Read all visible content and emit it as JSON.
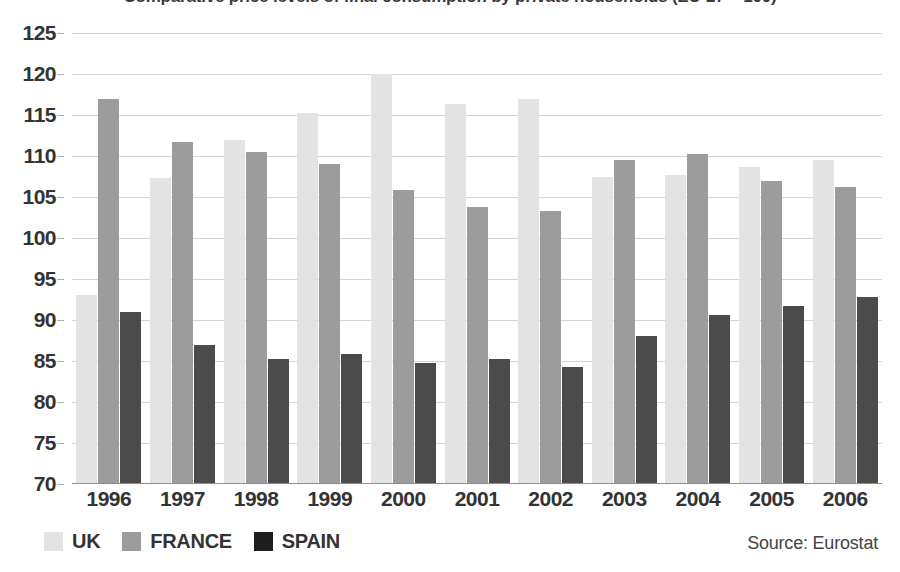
{
  "chart_data": {
    "type": "bar",
    "title": "Comparative price levels of final consumption by private households (EU-27 = 100)",
    "xlabel": "",
    "ylabel": "",
    "ylim": [
      70,
      125
    ],
    "ytick_step": 5,
    "yticks": [
      70,
      75,
      80,
      85,
      90,
      95,
      100,
      105,
      110,
      115,
      120,
      125
    ],
    "grid": true,
    "legend_position": "bottom-left",
    "categories": [
      "1996",
      "1997",
      "1998",
      "1999",
      "2000",
      "2001",
      "2002",
      "2003",
      "2004",
      "2005",
      "2006"
    ],
    "series": [
      {
        "name": "UK",
        "color": "#e3e3e3",
        "values": [
          93.0,
          107.3,
          112.0,
          115.3,
          120.0,
          116.3,
          117.0,
          107.5,
          107.7,
          108.7,
          109.5
        ]
      },
      {
        "name": "FRANCE",
        "color": "#9c9c9c",
        "values": [
          117.0,
          111.7,
          110.5,
          109.0,
          105.8,
          103.8,
          103.3,
          109.5,
          110.2,
          107.0,
          106.2
        ]
      },
      {
        "name": "SPAIN",
        "color": "#1d1d1d",
        "values": [
          91.0,
          87.0,
          85.3,
          85.8,
          84.8,
          85.3,
          84.3,
          88.0,
          90.6,
          91.7,
          92.8
        ]
      }
    ],
    "source": "Source: Eurostat"
  },
  "legend": {
    "items": [
      {
        "label": "UK",
        "key": "uk"
      },
      {
        "label": "FRANCE",
        "key": "fr"
      },
      {
        "label": "SPAIN",
        "key": "sp"
      }
    ]
  },
  "footer": {
    "source_text": "Source: Eurostat"
  }
}
